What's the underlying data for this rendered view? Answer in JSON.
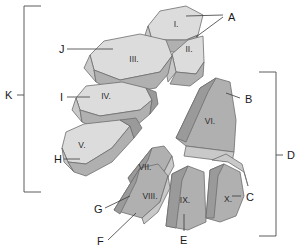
{
  "figure": {
    "background_color": "#ffffff",
    "colors": {
      "face_light": "#dcdcdc",
      "face_mid": "#c9c9c9",
      "face_dark": "#b0b0b0",
      "face_darker": "#9a9a9a",
      "outline": "#6d6d6d",
      "leader": "#3a3a3a",
      "text": "#1a1a1a"
    }
  },
  "segments": [
    {
      "id": "seg-1",
      "label": "I.",
      "x": 176,
      "y": 23
    },
    {
      "id": "seg-2",
      "label": "II.",
      "x": 189,
      "y": 48
    },
    {
      "id": "seg-3",
      "label": "III.",
      "x": 134,
      "y": 58
    },
    {
      "id": "seg-4",
      "label": "IV.",
      "x": 104,
      "y": 95
    },
    {
      "id": "seg-5",
      "label": "V.",
      "x": 80,
      "y": 146
    },
    {
      "id": "seg-6",
      "label": "VI.",
      "x": 210,
      "y": 123
    },
    {
      "id": "seg-7",
      "label": "VII.",
      "x": 145,
      "y": 168
    },
    {
      "id": "seg-8",
      "label": "VIII.",
      "x": 150,
      "y": 197
    },
    {
      "id": "seg-9",
      "label": "IX.",
      "x": 185,
      "y": 201
    },
    {
      "id": "seg-10",
      "label": "X.",
      "x": 228,
      "y": 200
    }
  ],
  "callouts": [
    {
      "id": "callout-a",
      "label": "A",
      "x": 228,
      "y": 17
    },
    {
      "id": "callout-b",
      "label": "B",
      "x": 245,
      "y": 99
    },
    {
      "id": "callout-c",
      "label": "C",
      "x": 246,
      "y": 197
    },
    {
      "id": "callout-e",
      "label": "E",
      "x": 183,
      "y": 237
    },
    {
      "id": "callout-f",
      "label": "F",
      "x": 101,
      "y": 242
    },
    {
      "id": "callout-g",
      "label": "G",
      "x": 98,
      "y": 209
    },
    {
      "id": "callout-h",
      "label": "H",
      "x": 57,
      "y": 160
    },
    {
      "id": "callout-i",
      "label": "I",
      "x": 62,
      "y": 99
    },
    {
      "id": "callout-j",
      "label": "J",
      "x": 61,
      "y": 50
    }
  ],
  "brackets": [
    {
      "id": "bracket-k",
      "label": "K",
      "label_x": 8,
      "label_y": 95,
      "side": "left",
      "top": 6,
      "bottom": 192,
      "x": 24
    },
    {
      "id": "bracket-d",
      "label": "D",
      "label_x": 290,
      "label_y": 156,
      "side": "right",
      "top": 72,
      "bottom": 236,
      "x": 276
    }
  ]
}
